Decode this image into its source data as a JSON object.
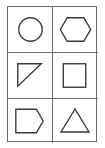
{
  "figure": {
    "type": "shape-grid",
    "rows": 3,
    "columns": 2,
    "line_color": "#6b6b6b",
    "stroke_color": "#3a3a3a",
    "cells": [
      {
        "row": 0,
        "col": 0,
        "shape": "circle"
      },
      {
        "row": 0,
        "col": 1,
        "shape": "hexagon"
      },
      {
        "row": 1,
        "col": 0,
        "shape": "right-triangle"
      },
      {
        "row": 1,
        "col": 1,
        "shape": "square"
      },
      {
        "row": 2,
        "col": 0,
        "shape": "pentagon"
      },
      {
        "row": 2,
        "col": 1,
        "shape": "triangle"
      }
    ]
  }
}
